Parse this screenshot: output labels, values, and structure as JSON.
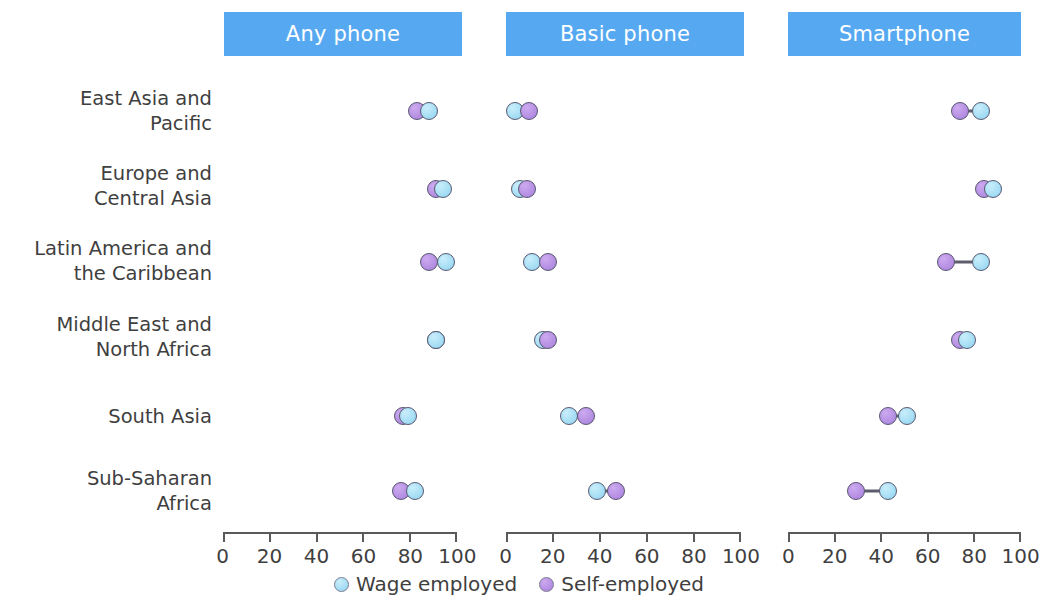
{
  "chart_data": {
    "type": "scatter",
    "title": "",
    "subtitle": "",
    "xlabel": "",
    "ylabel": "",
    "xlim": [
      0,
      100
    ],
    "grid": false,
    "legend_position": "bottom-center",
    "annotations": [],
    "panels": [
      {
        "label": "Any phone"
      },
      {
        "label": "Basic phone"
      },
      {
        "label": "Smartphone"
      }
    ],
    "categories": [
      "East Asia and\nPacific",
      "Europe and\nCentral Asia",
      "Latin America and\nthe Caribbean",
      "Middle East and\nNorth Africa",
      "South Asia",
      "Sub-Saharan\nAfrica"
    ],
    "tick_values": [
      0,
      20,
      40,
      60,
      80,
      100
    ],
    "tick_labels": [
      "0",
      "20",
      "40",
      "60",
      "80",
      "100"
    ],
    "series": [
      {
        "name": "Wage employed",
        "color": "#9fdcf4",
        "values": {
          "Any phone": [
            88,
            94,
            95,
            91,
            79,
            82
          ],
          "Basic phone": [
            4,
            6,
            11,
            16,
            27,
            39
          ],
          "Smartphone": [
            83,
            88,
            83,
            77,
            51,
            43
          ]
        }
      },
      {
        "name": "Self-employed",
        "color": "#b08ae0",
        "values": {
          "Any phone": [
            83,
            91,
            88,
            91,
            77,
            76
          ],
          "Basic phone": [
            10,
            9,
            18,
            18,
            34,
            47
          ],
          "Smartphone": [
            74,
            84,
            68,
            74,
            43,
            29
          ]
        }
      }
    ]
  },
  "legend": {
    "items": [
      {
        "label": "Wage employed",
        "marker": "circle-blue"
      },
      {
        "label": "Self-employed",
        "marker": "circle-purple"
      }
    ]
  },
  "colors": {
    "panel_header_bg": "#56a9f0",
    "panel_header_text": "#ffffff",
    "wage_employed": "#9fdcf4",
    "self_employed": "#b08ae0",
    "connector": "#5d5d6e",
    "axis": "#5a5a5a",
    "text": "#3f3f3f"
  }
}
